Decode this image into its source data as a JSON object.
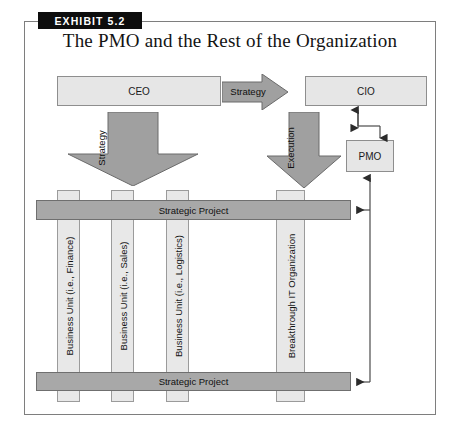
{
  "exhibit": {
    "label": "EXHIBIT 5.2"
  },
  "figure": {
    "title": "The PMO and the Rest of the Organization"
  },
  "nodes": {
    "ceo": "CEO",
    "cio": "CIO",
    "pmo": "PMO"
  },
  "flows": {
    "strategy_horizontal": "Strategy",
    "strategy_vertical": "Strategy",
    "execution_vertical": "Execution"
  },
  "bars": [
    {
      "label": "Strategic Project"
    },
    {
      "label": "Strategic Project"
    }
  ],
  "columns": [
    {
      "label": "Business Unit (i.e., Finance)"
    },
    {
      "label": "Business Unit (i.e., Sales)"
    },
    {
      "label": "Business Unit (i.e., Logistics)"
    },
    {
      "label": "Breakthrough IT Organization"
    }
  ],
  "colors": {
    "tab_background": "#0d0d0d",
    "tab_text": "#ffffff",
    "box_fill": "#e6e6e6",
    "box_stroke": "#8e8e8e",
    "bar_fill": "#a8a8a8",
    "bar_stroke": "#6f6f6f",
    "column_fill": "#e8e8e8",
    "column_stroke": "#9b9b9b",
    "arrow_fill": "#a0a0a0",
    "arrow_stroke": "#6a6a6a",
    "connector_stroke": "#4a4a4a",
    "frame_stroke": "#7e7e7e",
    "page_background": "#ffffff"
  }
}
